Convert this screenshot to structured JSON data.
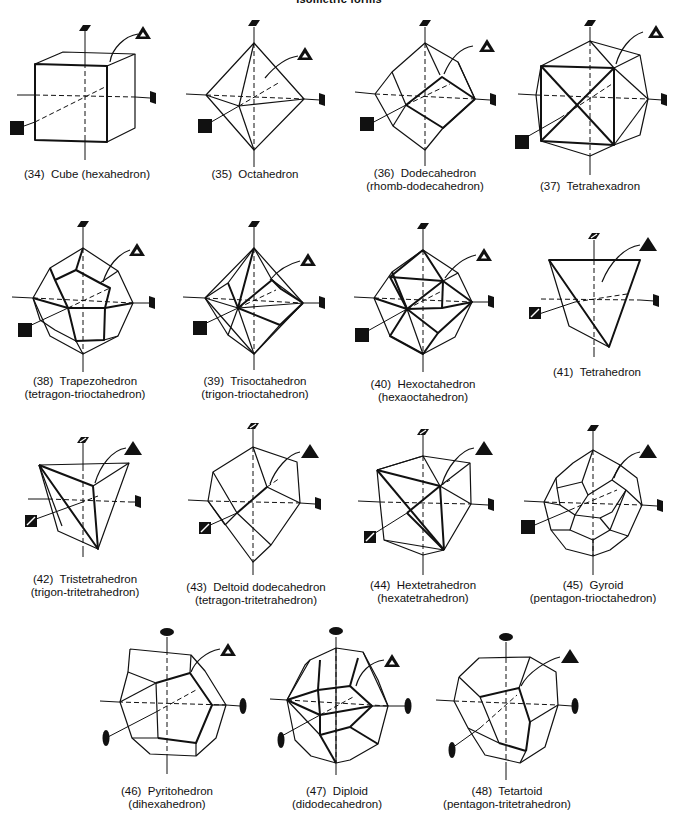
{
  "page": {
    "title": "Isometric forms"
  },
  "forms": [
    {
      "number": "(34)",
      "name": "Cube (hexahedron)",
      "alt": ""
    },
    {
      "number": "(35)",
      "name": "Octahedron",
      "alt": ""
    },
    {
      "number": "(36)",
      "name": "Dodecahedron",
      "alt": "(rhomb-dodecahedron)"
    },
    {
      "number": "(37)",
      "name": "Tetrahexadron",
      "alt": ""
    },
    {
      "number": "(38)",
      "name": "Trapezohedron",
      "alt": "(tetragon-trioctahedron)"
    },
    {
      "number": "(39)",
      "name": "Trisoctahedron",
      "alt": "(trigon-trioctahedron)"
    },
    {
      "number": "(40)",
      "name": "Hexoctahedron",
      "alt": "(hexaoctahedron)"
    },
    {
      "number": "(41)",
      "name": "Tetrahedron",
      "alt": ""
    },
    {
      "number": "(42)",
      "name": "Tristetrahedron",
      "alt": "(trigon-tritetrahedron)"
    },
    {
      "number": "(43)",
      "name": "Deltoid dodecahedron",
      "alt": "(tetragon-tritetrahedron)"
    },
    {
      "number": "(44)",
      "name": "Hextetrahedron",
      "alt": "(hexatetrahedron)"
    },
    {
      "number": "(45)",
      "name": "Gyroid",
      "alt": "(pentagon-trioctahedron)"
    },
    {
      "number": "(46)",
      "name": "Pyritohedron",
      "alt": "(dihexahedron)"
    },
    {
      "number": "(47)",
      "name": "Diploid",
      "alt": "(didodecahedron)"
    },
    {
      "number": "(48)",
      "name": "Tetartoid",
      "alt": "(pentagon-tritetrahedron)"
    }
  ],
  "symbols": {
    "four_fold_axis": "filled-square",
    "three_fold_axis_outlined": "outlined-triangle",
    "three_fold_axis_filled": "filled-triangle",
    "two_fold_axis": "filled-ellipse",
    "four_bar_axis": "hatched-square"
  }
}
